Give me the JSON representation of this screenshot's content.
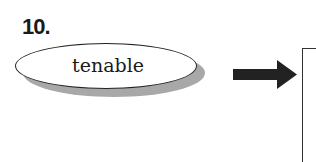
{
  "exercise": {
    "number_label": "10.",
    "word": "tenable",
    "arrow_icon": "right-arrow-icon",
    "answer_box": {
      "value": ""
    }
  },
  "colors": {
    "text": "#1a1a1a",
    "shadow": "#a8a8a8",
    "arrow": "#222222"
  }
}
